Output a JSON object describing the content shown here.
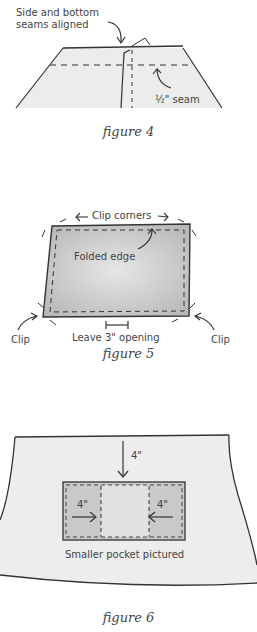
{
  "figure4": {
    "label_top_line1": "Side and bottom",
    "label_top_line2": "seams aligned",
    "label_seam": "½\" seam",
    "caption": "figure 4"
  },
  "figure5": {
    "label_corners": "Clip corners",
    "label_folded": "Folded edge",
    "label_clip_left": "Clip",
    "label_clip_right": "Clip",
    "label_opening": "Leave 3\" opening",
    "caption": "figure 5"
  },
  "figure6": {
    "label_top_measure": "4\"",
    "label_left_measure": "4\"",
    "label_right_measure": "4\"",
    "label_pocket": "Smaller pocket pictured",
    "caption": "figure 6"
  },
  "colors": {
    "ink": "#333333",
    "fill_light": "#ededed",
    "fill_dark": "#cfcfcf"
  }
}
